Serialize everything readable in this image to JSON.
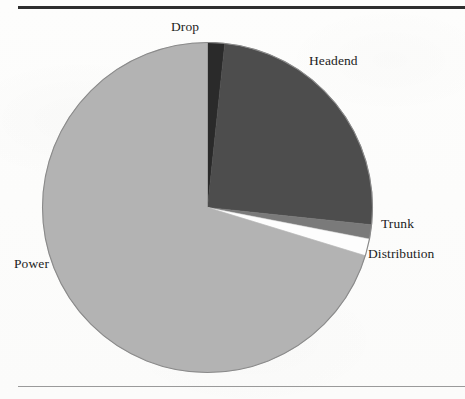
{
  "figure": {
    "caption": "",
    "top_rule_color": "#2e2e2e",
    "bottom_rule_color": "#9a9a9a",
    "background_color": "#fdfdfd"
  },
  "labels": {
    "drop": "Drop",
    "headend": "Headend",
    "trunk": "Trunk",
    "distribution": "Distribution",
    "power": "Power"
  },
  "chart_data": {
    "type": "pie",
    "title": "",
    "subtitle": "",
    "xlabel": "",
    "ylabel": "",
    "grid": false,
    "legend_position": "none",
    "label_placement": "outside-callout",
    "start_angle_deg": 0,
    "direction": "clockwise",
    "center_px": [
      207.5,
      207.5
    ],
    "radius_px": 165,
    "categories": [
      "Drop",
      "Headend",
      "Trunk",
      "Distribution",
      "Power"
    ],
    "values": [
      1.7,
      25.0,
      1.4,
      1.7,
      70.2
    ],
    "unit": "percent",
    "slices": [
      {
        "name": "Drop",
        "value": 1.7,
        "start_angle_deg": 0,
        "end_angle_deg": 6,
        "color": "#2a2a2a"
      },
      {
        "name": "Headend",
        "value": 25.0,
        "start_angle_deg": 6,
        "end_angle_deg": 96,
        "color": "#4d4d4d"
      },
      {
        "name": "Trunk",
        "value": 1.4,
        "start_angle_deg": 96,
        "end_angle_deg": 101,
        "color": "#7a7a7a"
      },
      {
        "name": "Distribution",
        "value": 1.7,
        "start_angle_deg": 101,
        "end_angle_deg": 107,
        "color": "#fdfdfd"
      },
      {
        "name": "Power",
        "value": 70.2,
        "start_angle_deg": 107,
        "end_angle_deg": 360,
        "color": "#b3b3b3"
      }
    ],
    "outline_color": "#8a8a8a"
  }
}
